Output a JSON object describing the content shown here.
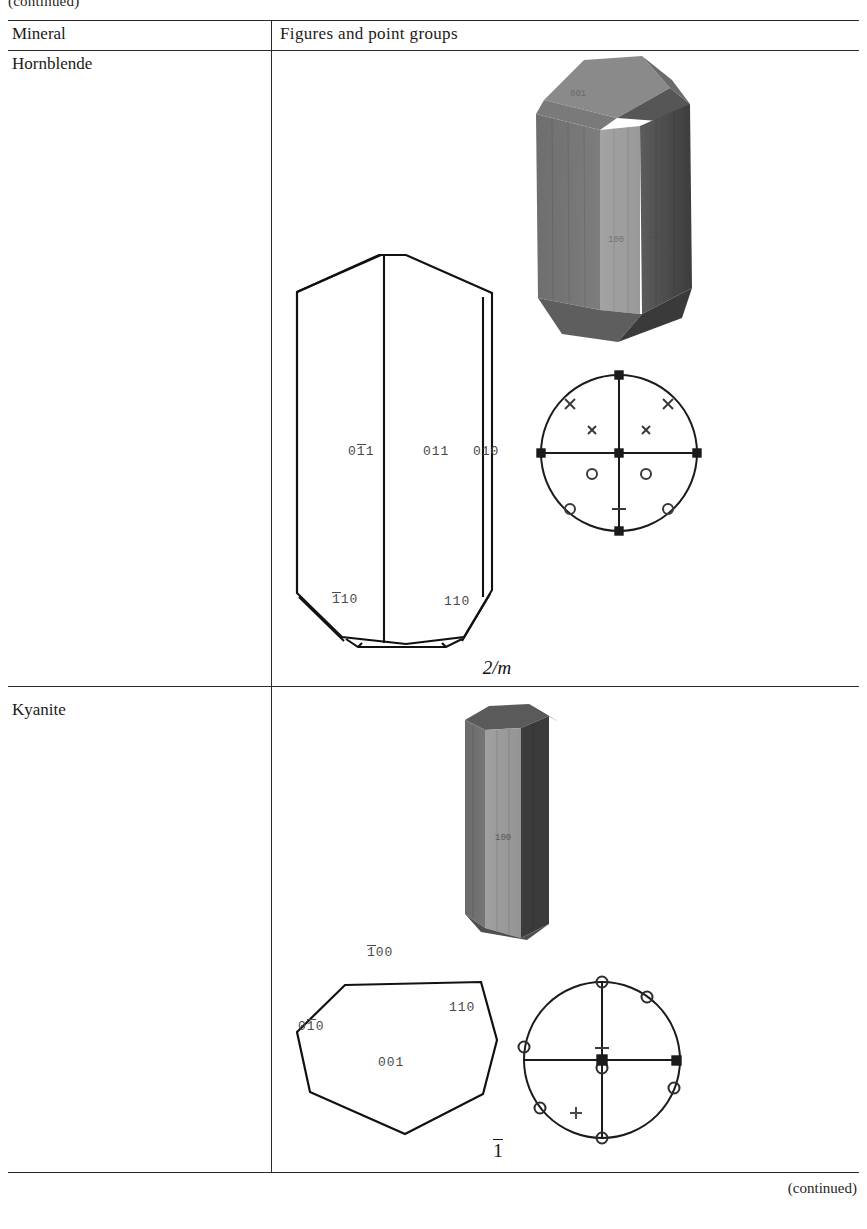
{
  "page": {
    "top_note": "(continued)",
    "bottom_note": "(continued)"
  },
  "table": {
    "columns": [
      {
        "key": "mineral",
        "label": "Mineral"
      },
      {
        "key": "figures",
        "label": "Figures and point groups"
      }
    ],
    "rows": [
      {
        "mineral": "Hornblende",
        "point_group": "2/m",
        "crystal_system": "monoclinic",
        "line_drawing_labels": [
          {
            "text": "011",
            "overbar_index": 1,
            "display": "0̱1̱1"
          },
          {
            "text": "011",
            "overbar_index": null,
            "display": "011"
          },
          {
            "text": "010",
            "overbar_index": null,
            "display": "010"
          },
          {
            "text": "110",
            "overbar_index": 0,
            "display": "1̱̱1 0"
          },
          {
            "text": "110",
            "overbar_index": null,
            "display": "110"
          }
        ],
        "label_texts": {
          "face_0bar11": "011",
          "face_011": "011",
          "face_010": "010",
          "face_bar110": "110",
          "face_110": "110"
        },
        "render_labels": {
          "top_left": "001",
          "center": "100",
          "top_right": "111"
        }
      },
      {
        "mineral": "Kyanite",
        "point_group": "1",
        "point_group_overbar": true,
        "crystal_system": "triclinic",
        "line_drawing_labels": [
          {
            "text": "100",
            "overbar_index": 0,
            "display": "100"
          },
          {
            "text": "110",
            "overbar_index": null,
            "display": "110"
          },
          {
            "text": "010",
            "overbar_index": 1,
            "display": "010"
          },
          {
            "text": "001",
            "overbar_index": null,
            "display": "001"
          }
        ],
        "label_texts": {
          "face_bar100": "100",
          "face_110": "110",
          "face_0bar10": "010",
          "face_001": "001"
        },
        "render_labels": {
          "front": "100"
        }
      }
    ]
  },
  "stereonets": [
    {
      "for": "Hornblende",
      "symbols": [
        {
          "type": "cross",
          "x": 0,
          "y": 0,
          "note": "center-upper"
        },
        {
          "type": "cross",
          "x": -0.14,
          "y": 0.15
        },
        {
          "type": "cross",
          "x": 0.14,
          "y": 0.15
        },
        {
          "type": "circle",
          "x": -0.14,
          "y": -0.15
        },
        {
          "type": "circle",
          "x": 0.14,
          "y": -0.15
        },
        {
          "type": "cross",
          "x": -0.62,
          "y": 0.78,
          "note": "rim"
        },
        {
          "type": "cross",
          "x": 0.62,
          "y": 0.78,
          "note": "rim"
        },
        {
          "type": "circle",
          "x": -0.62,
          "y": -0.78,
          "note": "rim"
        },
        {
          "type": "circle",
          "x": 0.62,
          "y": -0.78,
          "note": "rim"
        },
        {
          "type": "square",
          "x": 1.0,
          "y": 0.0,
          "note": "rim-east"
        },
        {
          "type": "square",
          "x": -1.0,
          "y": 0.0,
          "note": "rim-west"
        },
        {
          "type": "square",
          "x": 0.0,
          "y": 1.0,
          "note": "rim-north"
        },
        {
          "type": "square",
          "x": 0.0,
          "y": -1.0,
          "note": "rim-south"
        },
        {
          "type": "dash",
          "x": 0.0,
          "y": -0.8
        }
      ]
    },
    {
      "for": "Kyanite",
      "symbols": [
        {
          "type": "circle",
          "x": 0.0,
          "y": 1.0,
          "note": "rim-north"
        },
        {
          "type": "circle",
          "x": 0.58,
          "y": 0.8,
          "note": "rim"
        },
        {
          "type": "circle",
          "x": -1.0,
          "y": 0.17,
          "note": "rim-west"
        },
        {
          "type": "square",
          "x": 1.0,
          "y": 0.0,
          "note": "rim-east"
        },
        {
          "type": "circle",
          "x": 0.93,
          "y": -0.36,
          "note": "rim"
        },
        {
          "type": "circle",
          "x": -0.78,
          "y": -0.62,
          "note": "rim"
        },
        {
          "type": "circle",
          "x": 0.0,
          "y": -1.0,
          "note": "rim-south"
        },
        {
          "type": "square",
          "x": 0.0,
          "y": 0.0,
          "note": "center"
        },
        {
          "type": "circle",
          "x": 0.0,
          "y": -0.09,
          "note": "center-lower"
        },
        {
          "type": "dash",
          "x": 0.0,
          "y": 0.1
        },
        {
          "type": "plus",
          "x": -0.33,
          "y": -0.66
        }
      ]
    }
  ]
}
